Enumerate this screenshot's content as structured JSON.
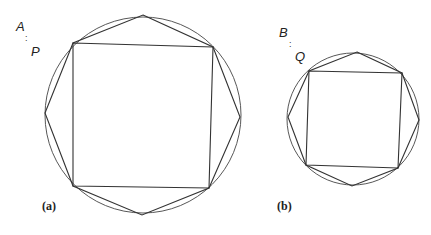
{
  "figure": {
    "stroke_color": "#333333",
    "background": "#ffffff",
    "panels": [
      {
        "id": "a",
        "caption": "(a)",
        "top_label": "A",
        "separator": ":",
        "bottom_label": "P",
        "circle": {
          "cx": 143,
          "cy": 115,
          "r": 98
        },
        "square": "73,43 213,47 209,188 73,186",
        "octagon": "143,15 213,47 240,117 209,188 142,215 73,186 45,113 73,43"
      },
      {
        "id": "b",
        "caption": "(b)",
        "top_label": "B",
        "separator": ":",
        "bottom_label": "Q",
        "circle": {
          "cx": 353,
          "cy": 119,
          "r": 66
        },
        "square": "309,71 402,73 398,168 306,165",
        "octagon": "357,52 402,73 419,120 398,168 352,186 306,165 288,117 309,71"
      }
    ]
  }
}
